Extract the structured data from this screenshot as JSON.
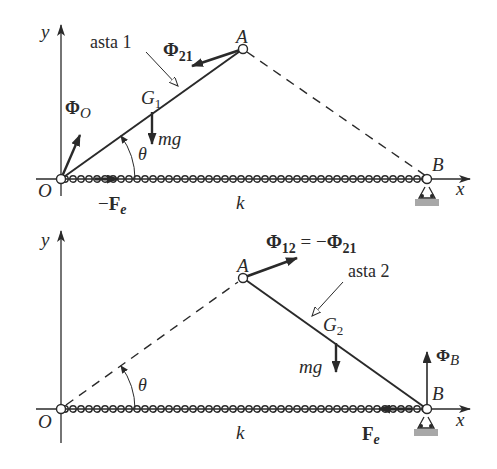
{
  "diagram": {
    "top": {
      "axis_y_label": "y",
      "axis_x_label": "x",
      "origin_label": "O",
      "point_a_label": "A",
      "point_b_label": "B",
      "rod_label": "asta 1",
      "center_label": "G",
      "center_sub": "1",
      "force_phi21": "Φ",
      "force_phi21_sub": "21",
      "force_phi_o": "Φ",
      "force_phi_o_sub": "O",
      "weight_label": "mg",
      "angle_label": "θ",
      "spring_force_minus": "−",
      "spring_force": "F",
      "spring_force_sub": "e",
      "spring_label": "k"
    },
    "bottom": {
      "axis_y_label": "y",
      "axis_x_label": "x",
      "origin_label": "O",
      "point_a_label": "A",
      "point_b_label": "B",
      "rod_label": "asta 2",
      "center_label": "G",
      "center_sub": "2",
      "force_phi12": "Φ",
      "force_phi12_sub": "12",
      "force_eq": " = −",
      "force_phi21": "Φ",
      "force_phi21_sub": "21",
      "force_phi_b": "Φ",
      "force_phi_b_sub": "B",
      "weight_label": "mg",
      "angle_label": "θ",
      "spring_force": "F",
      "spring_force_sub": "e",
      "spring_label": "k"
    },
    "colors": {
      "ink": "#2a2a2a",
      "support": "#a8a8a8"
    }
  }
}
